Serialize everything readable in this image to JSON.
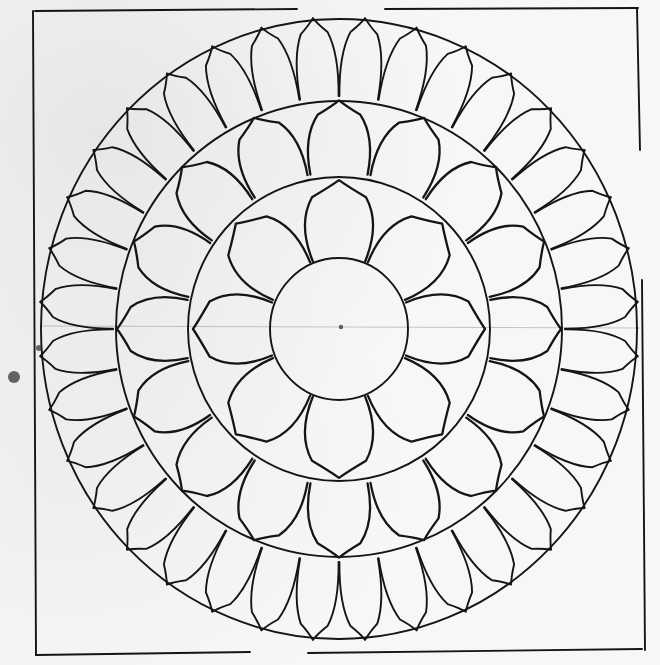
{
  "drawing": {
    "subject": "Hand-drawn lotus mandala sketch",
    "paper_color": "#f7f7f5",
    "ink_color": "#151515",
    "center": {
      "x": 339,
      "y": 329
    },
    "frame": {
      "segments": [
        {
          "x1": 35,
          "y1": 11,
          "x2": 297,
          "y2": 9
        },
        {
          "x1": 385,
          "y1": 9,
          "x2": 638,
          "y2": 8
        },
        {
          "x1": 33,
          "y1": 11,
          "x2": 36,
          "y2": 655
        },
        {
          "x1": 36,
          "y1": 655,
          "x2": 250,
          "y2": 652
        },
        {
          "x1": 308,
          "y1": 653,
          "x2": 642,
          "y2": 649
        },
        {
          "x1": 637,
          "y1": 8,
          "x2": 640,
          "y2": 150
        },
        {
          "x1": 642,
          "y1": 280,
          "x2": 645,
          "y2": 650
        }
      ]
    },
    "circles": [
      {
        "name": "center-disc",
        "rx": 69,
        "ry": 71
      },
      {
        "name": "inner-ring-circle",
        "rx": 151,
        "ry": 152
      },
      {
        "name": "middle-ring-circle",
        "rx": 223,
        "ry": 228
      },
      {
        "name": "outer-ring-circle",
        "rx": 298,
        "ry": 310
      }
    ],
    "petal_rings": [
      {
        "name": "inner-lotus-petals",
        "count": 8,
        "inner_r": 70,
        "outer_r": 146,
        "rotation_deg": 0,
        "width_ratio": 0.95
      },
      {
        "name": "middle-lotus-petals",
        "count": 16,
        "inner_r": 152,
        "outer_r": 222,
        "rotation_deg": 0,
        "width_ratio": 0.95
      },
      {
        "name": "outer-lotus-petals",
        "count": 36,
        "inner_r": 224,
        "outer_r": 300,
        "rotation_deg": 5,
        "width_ratio": 0.98
      }
    ],
    "guide_line": {
      "x1": 40,
      "y1": 326,
      "x2": 640,
      "y2": 328
    },
    "smudges": [
      {
        "x": 14,
        "y": 377,
        "r": 6
      },
      {
        "x": 39,
        "y": 348,
        "r": 3
      }
    ]
  }
}
